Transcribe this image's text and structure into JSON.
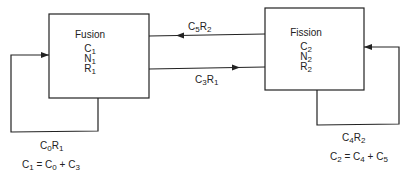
{
  "diagram": {
    "nodes": [
      {
        "id": "fusion",
        "title": "Fusion",
        "vars": [
          {
            "base": "C",
            "sub": "1"
          },
          {
            "base": "N",
            "sub": "1"
          },
          {
            "base": "R",
            "sub": "1"
          }
        ]
      },
      {
        "id": "fission",
        "title": "Fission",
        "vars": [
          {
            "base": "C",
            "sub": "2"
          },
          {
            "base": "N",
            "sub": "2"
          },
          {
            "base": "R",
            "sub": "2"
          }
        ]
      }
    ],
    "edges": [
      {
        "id": "fission-to-fusion",
        "from": "fission",
        "to": "fusion",
        "label": {
          "c": "C",
          "csub": "5",
          "r": "R",
          "rsub": "2"
        }
      },
      {
        "id": "fusion-to-fission",
        "from": "fusion",
        "to": "fission",
        "label": {
          "c": "C",
          "csub": "3",
          "r": "R",
          "rsub": "1"
        }
      },
      {
        "id": "fusion-self-loop",
        "from": "fusion",
        "to": "fusion",
        "label": {
          "c": "C",
          "csub": "0",
          "r": "R",
          "rsub": "1"
        }
      },
      {
        "id": "fission-self-loop",
        "from": "fission",
        "to": "fission",
        "label": {
          "c": "C",
          "csub": "4",
          "r": "R",
          "rsub": "2"
        }
      }
    ],
    "equations": [
      {
        "lhs": "C",
        "lhs_sub": "1",
        "eq": " = ",
        "a": "C",
        "a_sub": "0",
        "plus": " + ",
        "b": "C",
        "b_sub": "3"
      },
      {
        "lhs": "C",
        "lhs_sub": "2",
        "eq": " = ",
        "a": "C",
        "a_sub": "4",
        "plus": " + ",
        "b": "C",
        "b_sub": "5"
      }
    ],
    "colors": {
      "line": "#222222",
      "background": "#ffffff"
    }
  }
}
